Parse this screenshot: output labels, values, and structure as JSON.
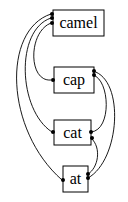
{
  "diagram": {
    "type": "suffix-link graph",
    "nodes": [
      {
        "id": "camel",
        "label": "camel"
      },
      {
        "id": "cap",
        "label": "cap"
      },
      {
        "id": "cat",
        "label": "cat"
      },
      {
        "id": "at",
        "label": "at"
      }
    ],
    "edges": [
      {
        "from": "camel",
        "to": "cap",
        "side": "left"
      },
      {
        "from": "camel",
        "to": "cat",
        "side": "left"
      },
      {
        "from": "camel",
        "to": "at",
        "side": "left"
      },
      {
        "from": "cap",
        "to": "cat",
        "side": "right"
      },
      {
        "from": "cap",
        "to": "at",
        "side": "right"
      },
      {
        "from": "cat",
        "to": "at",
        "side": "right"
      }
    ],
    "colors": {
      "stroke": "#000000",
      "background": "#ffffff"
    }
  }
}
